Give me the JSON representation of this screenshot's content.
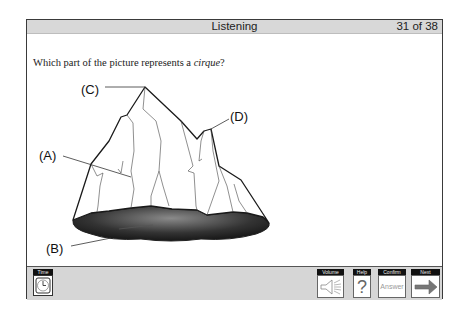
{
  "header": {
    "section_title": "Listening",
    "progress": "31 of 38"
  },
  "question": {
    "text_before": "Which part of the picture represents a ",
    "term": "cirque",
    "text_after": "?"
  },
  "figure": {
    "labels": [
      "(A)",
      "(B)",
      "(C)",
      "(D)"
    ]
  },
  "toolbar": {
    "time": {
      "label": "Time",
      "icon": "clock-icon"
    },
    "volume": {
      "label": "Volume",
      "icon": "speaker-icon"
    },
    "help": {
      "label": "Help",
      "icon": "question-mark-icon",
      "glyph": "?"
    },
    "confirm": {
      "label": "Confirm",
      "button_text": "Answer"
    },
    "next": {
      "label": "Next",
      "icon": "right-arrow-icon"
    }
  },
  "colors": {
    "titlebar_bg": "#d8d8d8",
    "toolbar_bg": "#d6d6d6",
    "label_bg": "#111111",
    "border": "#3a3a3a"
  }
}
